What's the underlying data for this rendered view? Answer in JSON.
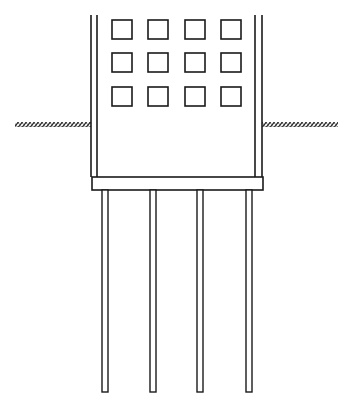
{
  "diagram": {
    "title": "Building on pile foundation",
    "colors": {
      "line": "#1a1a1a",
      "background": "#ffffff",
      "hatch": "#2a2a2a"
    },
    "building": {
      "label": "Building",
      "outer_left_x": 91,
      "inner_left_x": 97,
      "inner_right_x": 255,
      "outer_right_x": 262,
      "top_y": 15,
      "bottom_y": 177
    },
    "windows": {
      "label": "Windows",
      "rows": 3,
      "cols": 4,
      "col_x": [
        112,
        148,
        185,
        221
      ],
      "row_y": [
        20,
        53,
        87
      ],
      "width": 20,
      "height": 19
    },
    "ground": {
      "label": "Ground level",
      "left": {
        "x1": 15,
        "x2": 91
      },
      "right": {
        "x1": 262,
        "x2": 338
      },
      "y": 122,
      "thickness": 5
    },
    "pile_cap": {
      "label": "Pile cap",
      "x": 92,
      "y": 177,
      "width": 171,
      "height": 13
    },
    "piles": {
      "label": "Piles",
      "count": 4,
      "x": [
        102,
        150,
        197,
        246
      ],
      "width": 6,
      "top_y": 190,
      "bottom_y": 392
    }
  }
}
